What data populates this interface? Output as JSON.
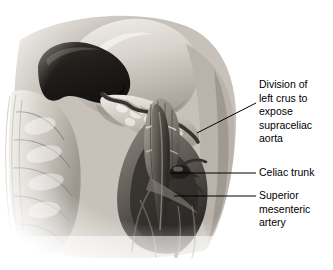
{
  "figure": {
    "type": "medical-illustration",
    "style": "grayscale pencil/airbrush anatomical drawing on white background",
    "background_color": "#ffffff",
    "ink_color": "#000000",
    "structures": [
      {
        "name": "spleen",
        "note": "dark crescent/kidney-bean shaped organ, upper left",
        "fill": "#2a2724"
      },
      {
        "name": "pancreas",
        "note": "lobulated body and tail extending right from splenic hilum",
        "fill": "#cfc9c1"
      },
      {
        "name": "splenic-artery",
        "note": "serpentine dark vessel along superior border of pancreas",
        "fill": "#4a4540"
      },
      {
        "name": "stomach-liver-mass",
        "note": "large smooth pale mass occupying upper center",
        "fill": "#d8d3cc"
      },
      {
        "name": "colon",
        "note": "haustrated bowel loops along left margin",
        "fill": "#c8c2ba"
      },
      {
        "name": "diaphragmatic-crus",
        "note": "divided muscular crus framed by inset rectangle",
        "fill": "#9b958d"
      },
      {
        "name": "supraceliac-aorta",
        "note": "vertical vessel within the outlined rectangle",
        "fill": "#6b655e"
      },
      {
        "name": "celiac-trunk",
        "note": "short branch arising anteriorly from aorta",
        "fill": "#3a352f"
      },
      {
        "name": "superior-mesenteric-artery",
        "note": "vessel arising below the celiac trunk, descending",
        "fill": "#45403a"
      },
      {
        "name": "retroperitoneal-tissue",
        "note": "surrounding soft tissue shading fading to white at edges",
        "fill": "#bdb7af"
      }
    ]
  },
  "labels": [
    {
      "id": "label-crus",
      "text": "Division of\nleft crus to\nexpose\nsupraceliac\naorta",
      "leader": {
        "type": "diagonal",
        "from": [
          197,
          133
        ],
        "to": [
          256,
          103
        ]
      }
    },
    {
      "id": "label-celiac",
      "text": "Celiac trunk",
      "leader": {
        "type": "horizontal",
        "from": [
          170,
          173
        ],
        "to": [
          256,
          173
        ]
      }
    },
    {
      "id": "label-sma",
      "text": "Superior\nmesenteric\nartery",
      "leader": {
        "type": "horizontal",
        "from": [
          174,
          196
        ],
        "to": [
          256,
          196
        ]
      }
    }
  ]
}
